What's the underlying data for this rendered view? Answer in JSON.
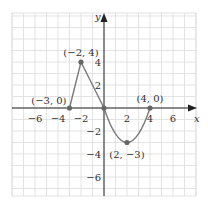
{
  "chart_data": {
    "type": "line",
    "title": "",
    "xlabel": "x",
    "ylabel": "y",
    "xlim": [
      -8,
      8
    ],
    "ylim": [
      -7.7,
      8.2
    ],
    "grid": true,
    "x_ticks": [
      -6,
      -4,
      -2,
      2,
      4,
      6
    ],
    "y_ticks": [
      -6,
      -4,
      -2,
      2,
      4
    ],
    "x_tick_labels": [
      "−6",
      "−4",
      "−2",
      "2",
      "4",
      "6"
    ],
    "y_tick_labels": [
      "−6",
      "−4",
      "−2",
      "2",
      "4"
    ],
    "series": [
      {
        "name": "f(x)",
        "segments": [
          {
            "kind": "line",
            "from": [
              -3,
              0
            ],
            "to": [
              -2,
              4
            ]
          },
          {
            "kind": "line",
            "from": [
              -2,
              4
            ],
            "to": [
              0,
              0
            ]
          },
          {
            "kind": "parabola",
            "from": [
              0,
              0
            ],
            "vertex": [
              2,
              -3
            ],
            "to": [
              4,
              0
            ]
          }
        ]
      }
    ],
    "points": [
      {
        "x": -3,
        "y": 0,
        "label": "(−3, 0)"
      },
      {
        "x": -2,
        "y": 4,
        "label": "(−2, 4)"
      },
      {
        "x": 0,
        "y": 0,
        "label": ""
      },
      {
        "x": 2,
        "y": -3,
        "label": "(2, −3)"
      },
      {
        "x": 4,
        "y": 0,
        "label": "(4, 0)"
      }
    ],
    "colors": {
      "curve": "#7a7a7a",
      "point": "#666666",
      "axis": "#222222",
      "grid": "#dcdcdc"
    }
  }
}
